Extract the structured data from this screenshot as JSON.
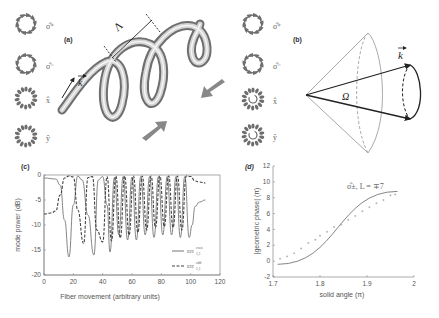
{
  "panels": {
    "a": {
      "label": "(a)",
      "period_symbol": "Λ",
      "k_symbol": "k",
      "modes": [
        "σ̂⁺",
        "σ̂⁻",
        "x̂",
        "ŷ"
      ]
    },
    "b": {
      "label": "(b)",
      "k_symbol": "k",
      "solid_angle_symbol": "Ω",
      "modes": [
        "σ̂⁺",
        "σ̂⁻",
        "x̂",
        "ŷ"
      ]
    }
  },
  "chart_data": [
    {
      "id": "c",
      "panel_label": "(c)",
      "type": "line",
      "title": "",
      "xlabel": "Fiber movement  (arbitrary units)",
      "ylabel": "mode power (dB)",
      "xlim": [
        0,
        120
      ],
      "ylim": [
        -20,
        0
      ],
      "xticks": [
        0,
        20,
        40,
        60,
        80,
        100,
        120
      ],
      "yticks": [
        0,
        -5,
        -10,
        -15,
        -20
      ],
      "legend": "bottom-right",
      "series": [
        {
          "name": "EH_{1,1}^{even}",
          "name_main": "EH",
          "name_sup": "even",
          "name_sub": "1,1",
          "style": "solid",
          "x": [
            0,
            8,
            11,
            14,
            17,
            20,
            23,
            26,
            30,
            34,
            37,
            40,
            43,
            45,
            48,
            51,
            54,
            57,
            60,
            63,
            66,
            69,
            72,
            75,
            78,
            81,
            84,
            87,
            90,
            93,
            96,
            99,
            101,
            103,
            106,
            110
          ],
          "y": [
            -0.6,
            -0.8,
            -2,
            -9,
            -16.4,
            -6,
            -0.2,
            -1,
            -8,
            -16,
            -1,
            -0.3,
            -6,
            -15.4,
            -0.5,
            -12,
            -0.3,
            -13,
            -0.4,
            -13,
            -0.3,
            -12,
            -0.3,
            -12.5,
            -0.3,
            -12,
            -0.3,
            -12,
            -0.3,
            -12.5,
            -0.3,
            -12.5,
            -10,
            -6.3,
            -5.4,
            -5
          ]
        },
        {
          "name": "EH_{1,1}^{odd}",
          "name_main": "EH",
          "name_sup": "odd",
          "name_sub": "1,1",
          "style": "dashed",
          "x": [
            0,
            5,
            8,
            11,
            14,
            17,
            20,
            23,
            27,
            30,
            33,
            36,
            40,
            43,
            46,
            49,
            52,
            55,
            58,
            61,
            64,
            67,
            70,
            73,
            76,
            79,
            82,
            85,
            88,
            91,
            94,
            97,
            100,
            103,
            106,
            110
          ],
          "y": [
            -7.8,
            -7.6,
            -7.2,
            -4,
            -0.6,
            -0.2,
            -0.4,
            -7,
            -13.7,
            -0.5,
            -0.3,
            -11,
            -13.4,
            -0.3,
            -13.2,
            -0.2,
            -12.6,
            -0.2,
            -12,
            -0.2,
            -11.5,
            -0.2,
            -11,
            -0.2,
            -10.5,
            -0.2,
            -10.3,
            -0.2,
            -10.5,
            -0.2,
            -11,
            -0.2,
            -0.3,
            -1.2,
            -1.4,
            -1.6
          ]
        }
      ]
    },
    {
      "id": "d",
      "panel_label": "(d)",
      "type": "scatter",
      "title": "",
      "xlabel": "solid angle (π)",
      "ylabel": "|geometric phase| (π)",
      "xlim": [
        1.7,
        2.0
      ],
      "ylim": [
        -2,
        12
      ],
      "xticks": [
        1.7,
        1.8,
        1.9,
        2
      ],
      "yticks": [
        -2,
        0,
        2,
        4,
        6,
        8,
        10,
        12
      ],
      "legend": "top-right",
      "annotation": "σ̂±, L = ∓7",
      "series": [
        {
          "name": "fit",
          "style": "solid",
          "x": [
            1.71,
            1.965
          ],
          "y": [
            -0.4,
            8.8
          ]
        },
        {
          "name": "data",
          "style": "markers",
          "x": [
            1.715,
            1.73,
            1.745,
            1.76,
            1.775,
            1.79,
            1.8,
            1.815,
            1.83,
            1.845,
            1.86,
            1.875,
            1.89,
            1.905,
            1.92,
            1.935,
            1.95,
            1.96
          ],
          "y": [
            0.3,
            0.6,
            1.0,
            1.6,
            2.3,
            2.7,
            3.2,
            3.7,
            4.3,
            4.6,
            5.2,
            5.7,
            6.3,
            6.8,
            7.3,
            7.7,
            8.3,
            8.4
          ]
        }
      ]
    }
  ]
}
